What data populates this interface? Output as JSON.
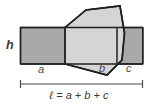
{
  "figure": {
    "labels": {
      "height": "h",
      "segment_a": "a",
      "segment_b": "b",
      "segment_c": "c"
    },
    "formula": "ℓ = a + b + c",
    "colors": {
      "dark_fill": "#a9a9a9",
      "light_fill": "#d5d5d5",
      "outline": "#1f1f1f",
      "divider": "#2b2b2b",
      "dimension_line": "#4a4a4a",
      "text": "#3a3a3a",
      "background": "#ffffff"
    },
    "geometry": {
      "band": {
        "x": 20,
        "y": 27,
        "width": 123,
        "height": 37
      },
      "divider_a_b_x": 65,
      "divider_b_c_x": 117,
      "polygon_points": "65,27 86,10 120,6 124,33 122,60 107,74 65,64",
      "dimension_y": 84,
      "dimension_x1": 20,
      "dimension_x2": 143
    }
  }
}
